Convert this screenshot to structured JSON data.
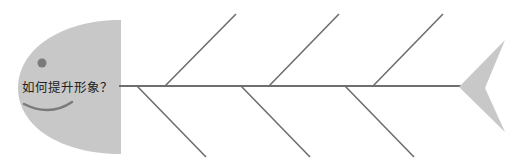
{
  "diagram": {
    "type": "fishbone",
    "head_label": "如何提升形象？",
    "colors": {
      "head_fill": "#c8c8c8",
      "tail_fill": "#c8c8c8",
      "bone_stroke": "#6e6e6e",
      "eye_fill": "#7a7a7a",
      "mouth_stroke": "#7a7a7a"
    },
    "upper_bones": 3,
    "lower_bones": 3
  }
}
